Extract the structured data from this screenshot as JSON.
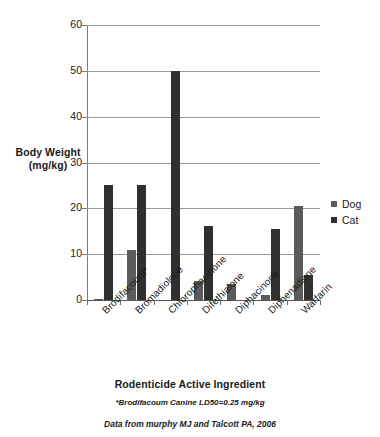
{
  "chart_data": {
    "type": "bar",
    "title": "",
    "xlabel": "Rodenticide Active Ingredient",
    "ylabel": "Body Weight\n(mg/kg)",
    "ylabel_line1": "Body Weight",
    "ylabel_line2": "(mg/kg)",
    "ylim": [
      0,
      60
    ],
    "ytick_labels": [
      "0",
      "10",
      "20",
      "30",
      "40",
      "50",
      "60"
    ],
    "ytick_values": [
      0,
      10,
      20,
      30,
      40,
      50,
      60
    ],
    "grid": true,
    "legend_position": "right",
    "categories": [
      "Brodifacoum*",
      "Bromadiolone",
      "Chlorophacinone",
      "Difethialone",
      "Diphacinone",
      "Diphenadione",
      "Warfarin"
    ],
    "series": [
      {
        "name": "Dog",
        "color": "#5b5b5b",
        "values": [
          0.25,
          11.0,
          0,
          4.2,
          3.4,
          1.0,
          20.5
        ]
      },
      {
        "name": "Cat",
        "color": "#303030",
        "values": [
          25.0,
          25.0,
          50.0,
          16.2,
          0,
          15.4,
          5.5
        ]
      }
    ],
    "annotations": [
      "*Brodifacoum Canine LD50=0.25 mg/kg",
      "Data from murphy MJ and Talcott PA, 2006"
    ]
  },
  "axis": {
    "y_title_line1": "Body Weight",
    "y_title_line2": "(mg/kg)",
    "x_title": "Rodenticide Active Ingredient"
  },
  "legend": {
    "items": [
      {
        "label": "Dog",
        "color": "#5b5b5b"
      },
      {
        "label": "Cat",
        "color": "#303030"
      }
    ]
  },
  "notes": {
    "footnote_1": "*Brodifacoum Canine LD50=0.25 mg/kg",
    "footnote_2": "Data from murphy MJ and Talcott PA, 2006"
  },
  "colors": {
    "dog": "#5b5b5b",
    "cat": "#303030",
    "gridline": "#9a9a9a",
    "axis": "#6d6d6d",
    "background": "#ffffff"
  }
}
